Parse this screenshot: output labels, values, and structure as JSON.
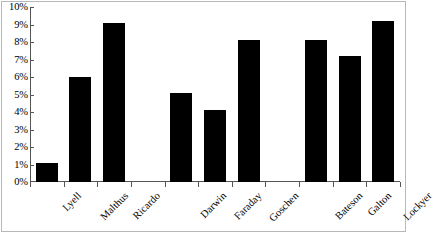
{
  "chart_data": {
    "type": "bar",
    "title": "",
    "subtitle": "",
    "xlabel": "",
    "ylabel": "",
    "categories": [
      "Lyell",
      "Malthus",
      "Ricardo",
      "Darwin",
      "Faraday",
      "Goschen",
      "Bateson",
      "Galton",
      "Lockyer"
    ],
    "values": [
      1.1,
      6.0,
      9.1,
      5.1,
      4.1,
      8.1,
      8.1,
      7.2,
      9.2
    ],
    "value_unit": "%",
    "ylim": [
      0,
      10
    ],
    "ytick_step": 1,
    "ytick_labels": [
      "10%",
      "9%",
      "8%",
      "7%",
      "6%",
      "5%",
      "4%",
      "3%",
      "2%",
      "1%",
      "0%"
    ],
    "ytick_values": [
      10,
      9,
      8,
      7,
      6,
      5,
      4,
      3,
      2,
      1,
      0
    ],
    "grid": false,
    "legend": null,
    "legend_position": "none",
    "bar_color": "#000000",
    "axis_color": "#555555",
    "background_color": "#ffffff",
    "slot_layout": [
      {
        "type": "bar",
        "index": 0
      },
      {
        "type": "bar",
        "index": 1
      },
      {
        "type": "bar",
        "index": 2
      },
      {
        "type": "gap"
      },
      {
        "type": "bar",
        "index": 3
      },
      {
        "type": "bar",
        "index": 4
      },
      {
        "type": "bar",
        "index": 5
      },
      {
        "type": "gap"
      },
      {
        "type": "bar",
        "index": 6
      },
      {
        "type": "bar",
        "index": 7
      },
      {
        "type": "bar",
        "index": 8
      }
    ],
    "groups": [
      {
        "members": [
          "Lyell",
          "Malthus",
          "Ricardo"
        ]
      },
      {
        "members": [
          "Darwin",
          "Faraday",
          "Goschen"
        ]
      },
      {
        "members": [
          "Bateson",
          "Galton",
          "Lockyer"
        ]
      }
    ]
  }
}
